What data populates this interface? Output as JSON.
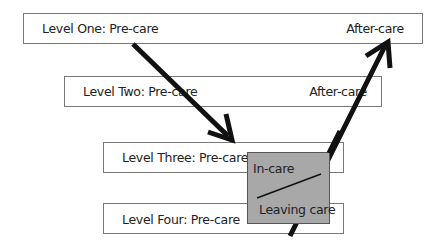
{
  "levels": [
    {
      "name": "Level One: Pre-care",
      "after": "After-care"
    },
    {
      "name": "Level Two: Pre-care",
      "after": "After-care"
    },
    {
      "name": "Level Three: Pre-care"
    },
    {
      "name": "Level Four: Pre-care"
    }
  ],
  "care_box": {
    "top": "In-care",
    "bottom": "Leaving care",
    "fill": "#a8a8a8"
  },
  "arrows": [
    {
      "from": "Level One: Pre-care",
      "to": "Level Three",
      "direction": "down"
    },
    {
      "from": "Leaving care",
      "to": "Level One: After-care",
      "direction": "up"
    }
  ]
}
